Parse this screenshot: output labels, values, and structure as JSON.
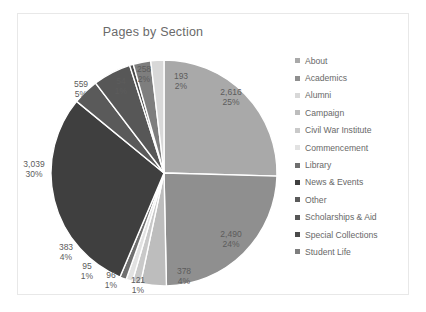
{
  "chart_data": {
    "type": "pie",
    "title": "Pages by Section",
    "legend_position": "right",
    "total": 10202,
    "categories": [
      "About",
      "Academics",
      "Alumni",
      "Campaign",
      "Civil War Institute",
      "Commencement",
      "Library",
      "News & Events",
      "Other",
      "Scholarships & Aid",
      "Special Collections",
      "Student Life"
    ],
    "values": [
      2616,
      2490,
      193,
      378,
      121,
      96,
      95,
      3039,
      383,
      559,
      54,
      258
    ],
    "value_labels": [
      "2,616",
      "2,490",
      "193",
      "378",
      "121",
      "96",
      "95",
      "3,039",
      "383",
      "559",
      "54",
      "258"
    ],
    "percent_labels": [
      "25%",
      "24%",
      "2%",
      "4%",
      "1%",
      "1%",
      "1%",
      "30%",
      "4%",
      "5%",
      "1%",
      "2%"
    ],
    "colors": [
      "#a9a9a9",
      "#8f8f8f",
      "#d8d8d8",
      "#bdbdbd",
      "#c9c9c9",
      "#e2e2e2",
      "#6f6f6f",
      "#3f3f3f",
      "#5a5a5a",
      "#575757",
      "#4a4a4a",
      "#7e7e7e"
    ],
    "slice_order_clockwise_from_top": [
      "About",
      "Academics",
      "Campaign",
      "Civil War Institute",
      "Commencement",
      "Library",
      "News & Events",
      "Other",
      "Scholarships & Aid",
      "Special Collections",
      "Student Life",
      "Alumni"
    ]
  },
  "legend": {
    "items": [
      {
        "label": "About"
      },
      {
        "label": "Academics"
      },
      {
        "label": "Alumni"
      },
      {
        "label": "Campaign"
      },
      {
        "label": "Civil War Institute"
      },
      {
        "label": "Commencement"
      },
      {
        "label": "Library"
      },
      {
        "label": "News & Events"
      },
      {
        "label": "Other"
      },
      {
        "label": "Scholarships & Aid"
      },
      {
        "label": "Special Collections"
      },
      {
        "label": "Student Life"
      }
    ]
  },
  "labels": [
    {
      "value": "2,616",
      "percent": "25%",
      "x": 213,
      "y": 73
    },
    {
      "value": "2,490",
      "percent": "24%",
      "x": 213,
      "y": 215
    },
    {
      "value": "378",
      "percent": "4%",
      "x": 166,
      "y": 252
    },
    {
      "value": "121",
      "percent": "1%",
      "x": 120,
      "y": 261
    },
    {
      "value": "96",
      "percent": "1%",
      "x": 93,
      "y": 256
    },
    {
      "value": "95",
      "percent": "1%",
      "x": 69,
      "y": 247
    },
    {
      "value": "3,039",
      "percent": "30%",
      "x": 16,
      "y": 145
    },
    {
      "value": "383",
      "percent": "4%",
      "x": 48,
      "y": 228
    },
    {
      "value": "559",
      "percent": "5%",
      "x": 63,
      "y": 65
    },
    {
      "value": "54",
      "percent": "1%",
      "x": 103,
      "y": 62
    },
    {
      "value": "258",
      "percent": "2%",
      "x": 126,
      "y": 50
    },
    {
      "value": "193",
      "percent": "2%",
      "x": 163,
      "y": 57
    }
  ]
}
